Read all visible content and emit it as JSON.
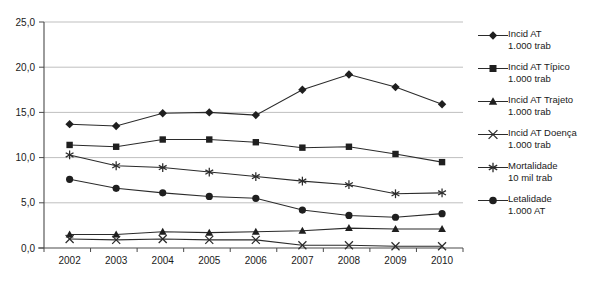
{
  "chart_data": {
    "type": "line",
    "title": "",
    "subtitle": "",
    "xlabel": "",
    "ylabel": "",
    "categories": [
      "2002",
      "2003",
      "2004",
      "2005",
      "2006",
      "2007",
      "2008",
      "2009",
      "2010"
    ],
    "x": [
      2002,
      2003,
      2004,
      2005,
      2006,
      2007,
      2008,
      2009,
      2010
    ],
    "ylim": [
      0,
      25
    ],
    "yticks": [
      0,
      5,
      10,
      15,
      20,
      25
    ],
    "ytick_labels": [
      "0,0",
      "5,0",
      "10,0",
      "15,0",
      "20,0",
      "25,0"
    ],
    "grid": true,
    "legend_position": "right",
    "decimal_separator": ",",
    "series": [
      {
        "name": "Incid AT",
        "unit": "1.000 trab",
        "marker": "diamond",
        "values": [
          13.7,
          13.5,
          14.9,
          15.0,
          14.7,
          17.5,
          19.2,
          17.8,
          15.9
        ]
      },
      {
        "name": "Incid AT Típico",
        "unit": "1.000 trab",
        "marker": "square",
        "values": [
          11.4,
          11.2,
          12.0,
          12.0,
          11.7,
          11.1,
          11.2,
          10.4,
          9.5
        ]
      },
      {
        "name": "Incid AT Trajeto",
        "unit": "1.000 trab",
        "marker": "triangle",
        "values": [
          1.5,
          1.5,
          1.8,
          1.7,
          1.8,
          1.9,
          2.2,
          2.1,
          2.1
        ]
      },
      {
        "name": "Incid AT Doença",
        "unit": "1.000 trab",
        "marker": "x",
        "values": [
          1.0,
          0.9,
          1.0,
          0.9,
          0.9,
          0.3,
          0.3,
          0.2,
          0.2
        ]
      },
      {
        "name": "Mortalidade",
        "unit": "10 mil trab",
        "marker": "asterisk",
        "values": [
          10.3,
          9.1,
          8.9,
          8.4,
          7.9,
          7.4,
          7.0,
          6.0,
          6.1
        ]
      },
      {
        "name": "Letalidade",
        "unit": "1.000 AT",
        "marker": "circle",
        "values": [
          7.6,
          6.6,
          6.1,
          5.7,
          5.5,
          4.2,
          3.6,
          3.4,
          3.8
        ]
      }
    ]
  },
  "legend": {
    "items": [
      {
        "label": "Incid AT",
        "sublabel": "1.000 trab",
        "marker": "diamond"
      },
      {
        "label": "Incid AT Típico",
        "sublabel": "1.000 trab",
        "marker": "square"
      },
      {
        "label": "Incid AT Trajeto",
        "sublabel": "1.000 trab",
        "marker": "triangle"
      },
      {
        "label": "Incid AT Doença",
        "sublabel": "1.000 trab",
        "marker": "x"
      },
      {
        "label": "Mortalidade",
        "sublabel": "10 mil trab",
        "marker": "asterisk"
      },
      {
        "label": "Letalidade",
        "sublabel": "1.000 AT",
        "marker": "circle"
      }
    ]
  },
  "caption": {
    "text": ""
  }
}
